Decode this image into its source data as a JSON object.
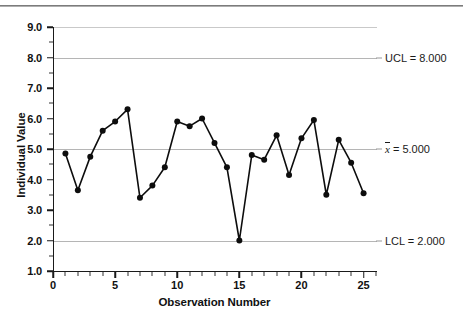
{
  "chart_data": {
    "type": "line",
    "title": "",
    "subtitle": "",
    "xlabel": "Observation Number",
    "ylabel": "Individual Value",
    "xlim": [
      0,
      26
    ],
    "ylim": [
      1.0,
      9.0
    ],
    "grid": true,
    "legend": null,
    "x": [
      1,
      2,
      3,
      4,
      5,
      6,
      7,
      8,
      9,
      10,
      11,
      12,
      13,
      14,
      15,
      16,
      17,
      18,
      19,
      20,
      21,
      22,
      23,
      24,
      25
    ],
    "values": [
      4.85,
      3.65,
      4.75,
      5.6,
      5.9,
      6.3,
      3.4,
      3.8,
      4.4,
      5.9,
      5.75,
      6.0,
      5.2,
      4.4,
      2.0,
      4.8,
      4.65,
      5.45,
      4.15,
      5.35,
      5.95,
      3.5,
      5.3,
      4.55,
      3.55
    ],
    "series": [
      {
        "name": "Individual Value",
        "values": [
          4.85,
          3.65,
          4.75,
          5.6,
          5.9,
          6.3,
          3.4,
          3.8,
          4.4,
          5.9,
          5.75,
          6.0,
          5.2,
          4.4,
          2.0,
          4.8,
          4.65,
          5.45,
          4.15,
          5.35,
          5.95,
          3.5,
          5.3,
          4.55,
          3.55
        ],
        "marker": "circle",
        "color": "#0d0d0d"
      }
    ],
    "y_tick_labels": [
      "9.0",
      "8.0",
      "7.0",
      "6.0",
      "5.0",
      "4.0",
      "3.0",
      "2.0",
      "1.0"
    ],
    "y_tick_values": [
      9.0,
      8.0,
      7.0,
      6.0,
      5.0,
      4.0,
      3.0,
      2.0,
      1.0
    ],
    "x_tick_labels": [
      "0",
      "5",
      "10",
      "15",
      "20",
      "25"
    ],
    "x_tick_values": [
      0,
      5,
      10,
      15,
      20,
      25
    ],
    "control_limits": {
      "ucl": {
        "label": "UCL = 8.000",
        "value": 8.0
      },
      "center": {
        "label_prefix": "x",
        "label_suffix": " = 5.000",
        "value": 5.0
      },
      "lcl": {
        "label": "LCL = 2.000",
        "value": 2.0
      }
    },
    "annotations": [
      {
        "text": "UCL = 8.000",
        "y": 8.0
      },
      {
        "text": "x̄ = 5.000",
        "y": 5.0
      },
      {
        "text": "LCL = 2.000",
        "y": 2.0
      }
    ],
    "colors": {
      "series": "#0d0d0d",
      "gridline": "#c9c9c9",
      "limit_line": "#b5b5b5",
      "axis": "#1a1a1a",
      "background": "#ffffff"
    }
  }
}
